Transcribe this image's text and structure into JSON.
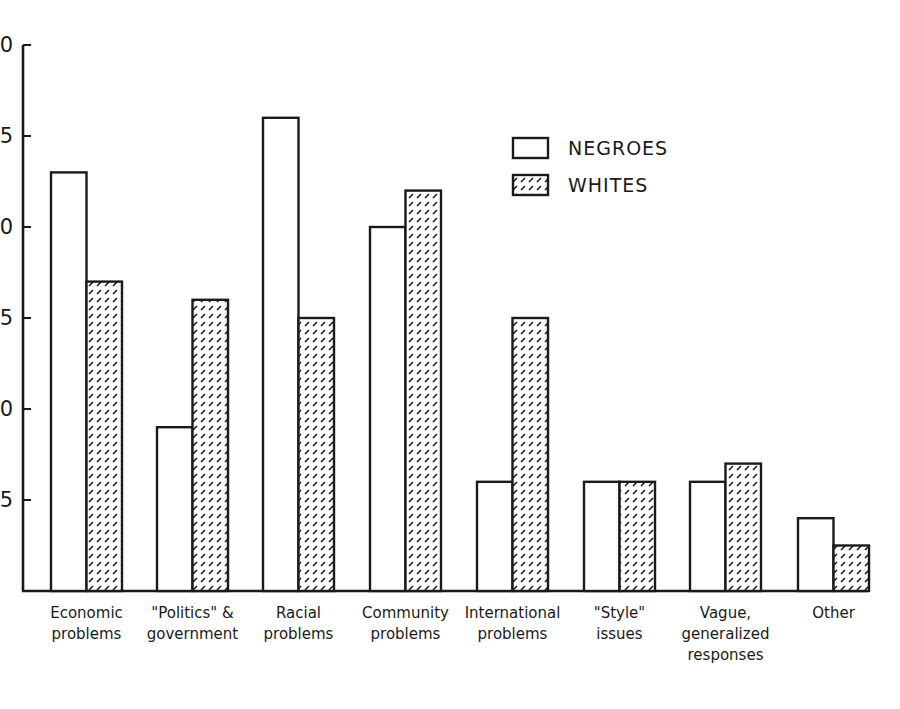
{
  "chart_data": {
    "type": "bar",
    "title": "",
    "xlabel": "",
    "ylabel": "",
    "ylim": [
      0,
      30
    ],
    "yticks": [
      5,
      10,
      15,
      20,
      25,
      30
    ],
    "ytick_labels_visible": [
      "5",
      "0",
      "5",
      "0",
      "5",
      "0"
    ],
    "grid": false,
    "legend_position": "upper right (inside plot)",
    "categories": [
      "Economic problems",
      "\"Politics\" & government",
      "Racial problems",
      "Community problems",
      "International problems",
      "\"Style\" issues",
      "Vague, generalized responses",
      "Other"
    ],
    "category_label_lines": [
      [
        "Economic",
        "problems"
      ],
      [
        "\"Politics\" &",
        "government"
      ],
      [
        "Racial",
        "problems"
      ],
      [
        "Community",
        "problems"
      ],
      [
        "International",
        "problems"
      ],
      [
        "\"Style\"",
        "issues"
      ],
      [
        "Vague,",
        "generalized",
        "responses"
      ],
      [
        "Other"
      ]
    ],
    "series": [
      {
        "name": "NEGROES",
        "fill": "white",
        "values": [
          23,
          9,
          26,
          20,
          6,
          6,
          6,
          4
        ]
      },
      {
        "name": "WHITES",
        "fill": "hatched",
        "values": [
          17,
          16,
          15,
          22,
          15,
          6,
          7,
          2.5
        ]
      }
    ]
  },
  "legend": {
    "items": [
      {
        "label": "NEGROES",
        "style": "open"
      },
      {
        "label": "WHITES",
        "style": "hatched"
      }
    ]
  },
  "colors": {
    "ink": "#1a1a1a",
    "background": "#ffffff"
  }
}
